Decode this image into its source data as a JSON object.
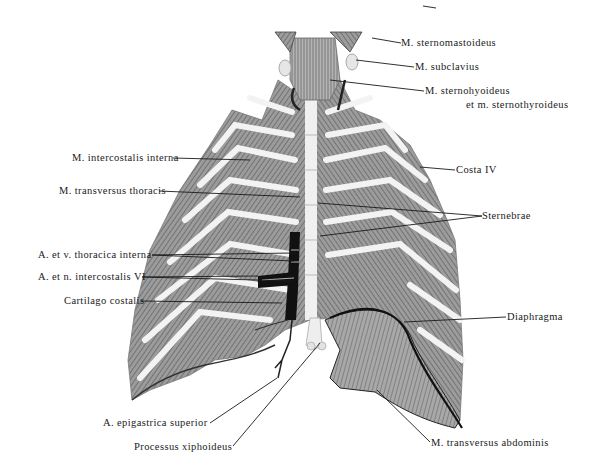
{
  "figure": {
    "colors": {
      "ink": "#1a1a1a",
      "muscle": "#8a8a8a",
      "rib": "#f2f2f2",
      "vessel": "#111111",
      "background": "#ffffff"
    }
  },
  "labels": {
    "sternomastoideus": {
      "text": "M. sternomastoideus",
      "x": 401,
      "y": 38,
      "tip": [
        372,
        38
      ],
      "anchor": "left"
    },
    "subclavius": {
      "text": "M. subclavius",
      "x": 414,
      "y": 62,
      "tip": [
        356,
        60
      ],
      "anchor": "left"
    },
    "sternohyoideus_1": {
      "text": "M. sternohyoideus",
      "x": 424,
      "y": 86,
      "tip": [
        330,
        80
      ],
      "anchor": "left"
    },
    "sternohyoideus_2": {
      "text": "et m. sternothyroideus",
      "x": 466,
      "y": 100
    },
    "intercostalis_interna": {
      "text": "M. intercostalis interna",
      "x": 72,
      "y": 153,
      "tip": [
        250,
        160
      ],
      "anchor": "right"
    },
    "transversus_thoracis": {
      "text": "M. transversus thoracis",
      "x": 59,
      "y": 186,
      "tip": [
        300,
        197
      ],
      "anchor": "right"
    },
    "costa_iv": {
      "text": "Costa IV",
      "x": 455,
      "y": 165,
      "tip": [
        420,
        167
      ],
      "anchor": "left"
    },
    "sternebrae": {
      "text": "Sternebrae",
      "x": 482,
      "y": 211,
      "tips": [
        [
          318,
          203
        ],
        [
          320,
          236
        ]
      ],
      "anchor": "left"
    },
    "thoracica_interna": {
      "text": "A. et v. thoracica interna",
      "x": 38,
      "y": 250,
      "tips": [
        [
          294,
          253
        ],
        [
          294,
          261
        ]
      ],
      "anchor": "right"
    },
    "intercostalis_vi": {
      "text": "A. et n. intercostalis VI",
      "x": 38,
      "y": 272,
      "tips": [
        [
          258,
          276
        ],
        [
          294,
          279
        ]
      ],
      "anchor": "right"
    },
    "cartilago_costalis": {
      "text": "Cartilago costalis",
      "x": 64,
      "y": 296,
      "tip": [
        282,
        303
      ],
      "anchor": "right"
    },
    "diaphragma": {
      "text": "Diaphragma",
      "x": 506,
      "y": 312,
      "tip": [
        404,
        322
      ],
      "anchor": "left"
    },
    "epigastrica_superior": {
      "text": "A. epigastrica superior",
      "x": 103,
      "y": 418,
      "tip": [
        277,
        375
      ],
      "anchor": "right"
    },
    "processus_xiphoideus": {
      "text": "Processus xiphoideus",
      "x": 134,
      "y": 442,
      "tip": [
        320,
        343
      ],
      "anchor": "right"
    },
    "transversus_abdominis": {
      "text": "M. transversus abdominis",
      "x": 430,
      "y": 437,
      "tip": [
        377,
        390
      ],
      "anchor": "left"
    }
  }
}
